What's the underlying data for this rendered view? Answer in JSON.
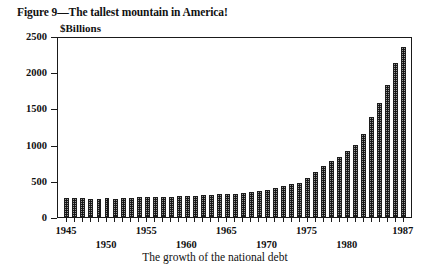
{
  "figure": {
    "title": "Figure 9—The tallest mountain in America!",
    "caption": "The growth of the national debt",
    "y_axis_unit": "$Billions"
  },
  "chart_data": {
    "type": "bar",
    "title": "Figure 9—The tallest mountain in America!",
    "subtitle": "The growth of the national debt",
    "xlabel": "",
    "ylabel": "$Billions",
    "ylim": [
      0,
      2500
    ],
    "y_ticks_major": [
      0,
      500,
      1000,
      1500,
      2000,
      2500
    ],
    "y_tick_labels": [
      "0",
      "500",
      "1000",
      "1500",
      "2000",
      "2500"
    ],
    "y_minor_tick_interval": 100,
    "grid": false,
    "legend": false,
    "bar_fill": "checkered-dither-gray",
    "bar_outline_color": "#1c1c1c",
    "frame_color": "#1a1a1a",
    "background_color": "#ffffff",
    "x_tick_labels_shown": [
      "1945",
      "1950",
      "1955",
      "1960",
      "1965",
      "1970",
      "1975",
      "1980",
      "1987"
    ],
    "x_label_layout": "alternating two rows",
    "categories": [
      "1945",
      "1946",
      "1947",
      "1948",
      "1949",
      "1950",
      "1951",
      "1952",
      "1953",
      "1954",
      "1955",
      "1956",
      "1957",
      "1958",
      "1959",
      "1960",
      "1961",
      "1962",
      "1963",
      "1964",
      "1965",
      "1966",
      "1967",
      "1968",
      "1969",
      "1970",
      "1971",
      "1972",
      "1973",
      "1974",
      "1975",
      "1976",
      "1977",
      "1978",
      "1979",
      "1980",
      "1981",
      "1982",
      "1983",
      "1984",
      "1985",
      "1986",
      "1987"
    ],
    "values": [
      259,
      269,
      258,
      252,
      253,
      257,
      255,
      259,
      266,
      271,
      274,
      273,
      271,
      276,
      285,
      286,
      289,
      298,
      306,
      312,
      317,
      320,
      326,
      348,
      354,
      371,
      398,
      427,
      458,
      475,
      533,
      620,
      699,
      772,
      827,
      908,
      998,
      1142,
      1377,
      1572,
      1823,
      2125,
      2350
    ]
  }
}
